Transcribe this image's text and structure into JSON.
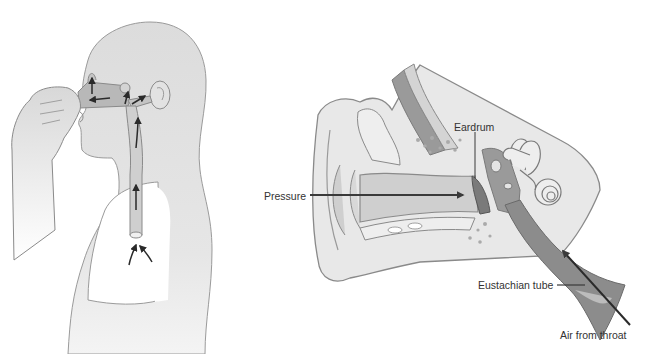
{
  "figure": {
    "left_panel": {
      "description": "Person pinching nose with airflow arrows from lungs through airway to ear",
      "arrow_count": 7
    },
    "right_panel": {
      "description": "Cross-section of the ear showing pressure and air from throat via eustachian tube",
      "labels": {
        "eardrum": "Eardrum",
        "pressure": "Pressure",
        "eustachian_tube": "Eustachian tube",
        "air_from_throat": "Air from throat"
      }
    },
    "colors": {
      "background": "#ffffff",
      "skin_light": "#e4e4e4",
      "skin_mid": "#cfcfcf",
      "outline": "#8a8a8a",
      "airway_dark": "#9a9a9a",
      "arrow": "#2a2a2a",
      "text": "#333333"
    }
  }
}
